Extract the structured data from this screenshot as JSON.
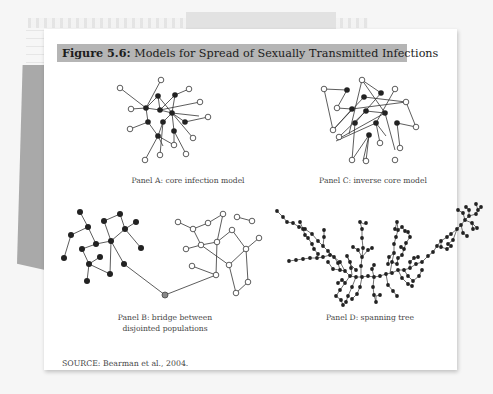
{
  "figure": {
    "label": "Figure 5.6:",
    "title": "Models for Spread of Sexually Transmitted Infections",
    "title_bar_color": "#b5b5b5",
    "panels": [
      {
        "id": "A",
        "caption": "Panel A: core infection model"
      },
      {
        "id": "C",
        "caption": "Panel C: inverse core model"
      },
      {
        "id": "B",
        "caption_line1": "Panel B: bridge between",
        "caption_line2": "disjointed populations"
      },
      {
        "id": "D",
        "caption": "Panel D: spanning tree"
      }
    ],
    "source": "SOURCE: Bearman et al., 2004."
  },
  "legend_semantics": {
    "filled_node_color": "#222222",
    "open_node_color": "#ffffff",
    "bridge_node_color": "#888888"
  }
}
